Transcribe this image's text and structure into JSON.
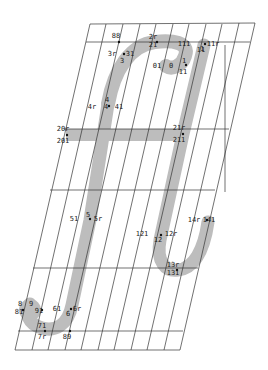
{
  "diagram": {
    "type": "glyph-outline",
    "glyph": "H",
    "colors": {
      "background": "#ffffff",
      "stroke_fill": "#bdbdbd",
      "grid": "#333333",
      "label": "#222222",
      "point": "#111111"
    },
    "grid": {
      "horizontal_lines_y": [
        24,
        42,
        129,
        190,
        268,
        331,
        350
      ],
      "top_left_x": 90,
      "top_right_x": 255,
      "bottom_left_x": 15,
      "bottom_right_x": 180,
      "vertical_count": 12
    },
    "labels": [
      {
        "id": "88",
        "text": "88",
        "x": 116,
        "y": 38
      },
      {
        "id": "2r",
        "text": "2r",
        "x": 153,
        "y": 39
      },
      {
        "id": "21",
        "text": "21",
        "x": 153,
        "y": 47
      },
      {
        "id": "3r",
        "text": "3r",
        "x": 112,
        "y": 56
      },
      {
        "id": "31",
        "text": "31",
        "x": 130,
        "y": 56
      },
      {
        "id": "3",
        "text": "3",
        "x": 122,
        "y": 63
      },
      {
        "id": "111",
        "text": "111",
        "x": 184,
        "y": 46
      },
      {
        "id": "11r",
        "text": "11r",
        "x": 213,
        "y": 46
      },
      {
        "id": "1",
        "text": "1",
        "x": 202,
        "y": 51
      },
      {
        "id": "11",
        "text": "11",
        "x": 201,
        "y": 52
      },
      {
        "id": "01",
        "text": "01",
        "x": 157,
        "y": 68
      },
      {
        "id": "0",
        "text": "0",
        "x": 171,
        "y": 68
      },
      {
        "id": "i",
        "text": "1",
        "x": 184,
        "y": 63
      },
      {
        "id": "i1",
        "text": "11",
        "x": 183,
        "y": 74
      },
      {
        "id": "4r",
        "text": "4r",
        "x": 92,
        "y": 109
      },
      {
        "id": "4",
        "text": "4",
        "x": 107,
        "y": 102
      },
      {
        "id": "4c",
        "text": "4",
        "x": 106,
        "y": 109
      },
      {
        "id": "41",
        "text": "41",
        "x": 119,
        "y": 109
      },
      {
        "id": "20r",
        "text": "20r",
        "x": 63,
        "y": 131
      },
      {
        "id": "201",
        "text": "201",
        "x": 63,
        "y": 143
      },
      {
        "id": "21r",
        "text": "21r",
        "x": 179,
        "y": 130
      },
      {
        "id": "211",
        "text": "211",
        "x": 179,
        "y": 142
      },
      {
        "id": "51",
        "text": "51",
        "x": 74,
        "y": 221
      },
      {
        "id": "5",
        "text": "5",
        "x": 88,
        "y": 217
      },
      {
        "id": "5r",
        "text": "5r",
        "x": 98,
        "y": 221
      },
      {
        "id": "121",
        "text": "121",
        "x": 142,
        "y": 236
      },
      {
        "id": "12r",
        "text": "12r",
        "x": 171,
        "y": 236
      },
      {
        "id": "12",
        "text": "12",
        "x": 158,
        "y": 242
      },
      {
        "id": "14r",
        "text": "14r",
        "x": 194,
        "y": 222
      },
      {
        "id": "141",
        "text": "141",
        "x": 209,
        "y": 222
      },
      {
        "id": "13r",
        "text": "13r",
        "x": 173,
        "y": 267
      },
      {
        "id": "131",
        "text": "131",
        "x": 173,
        "y": 275
      },
      {
        "id": "8",
        "text": "8",
        "x": 20,
        "y": 306
      },
      {
        "id": "9",
        "text": "9",
        "x": 31,
        "y": 306
      },
      {
        "id": "81",
        "text": "81",
        "x": 19,
        "y": 314
      },
      {
        "id": "91",
        "text": "91",
        "x": 39,
        "y": 313
      },
      {
        "id": "61",
        "text": "61",
        "x": 57,
        "y": 311
      },
      {
        "id": "6r",
        "text": "6r",
        "x": 77,
        "y": 311
      },
      {
        "id": "6",
        "text": "6",
        "x": 68,
        "y": 316
      },
      {
        "id": "71",
        "text": "71",
        "x": 42,
        "y": 328
      },
      {
        "id": "7r",
        "text": "7r",
        "x": 42,
        "y": 339
      },
      {
        "id": "89",
        "text": "89",
        "x": 67,
        "y": 339
      }
    ],
    "points": [
      {
        "x": 119,
        "y": 42
      },
      {
        "x": 157,
        "y": 42
      },
      {
        "x": 124,
        "y": 54
      },
      {
        "x": 205,
        "y": 44
      },
      {
        "x": 186,
        "y": 65
      },
      {
        "x": 109,
        "y": 106
      },
      {
        "x": 67,
        "y": 135
      },
      {
        "x": 183,
        "y": 134
      },
      {
        "x": 90,
        "y": 219
      },
      {
        "x": 161,
        "y": 235
      },
      {
        "x": 207,
        "y": 220
      },
      {
        "x": 177,
        "y": 270
      },
      {
        "x": 23,
        "y": 310
      },
      {
        "x": 42,
        "y": 310
      },
      {
        "x": 71,
        "y": 309
      },
      {
        "x": 45,
        "y": 331
      },
      {
        "x": 70,
        "y": 331
      }
    ]
  }
}
